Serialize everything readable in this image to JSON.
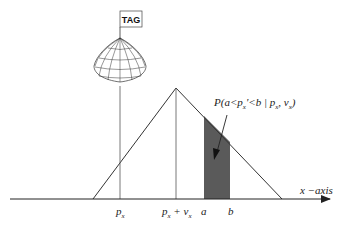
{
  "diagram": {
    "tag_label": "TAG",
    "probability_label": "P(a<p",
    "probability_label_full": "P(a<p'x<b | px, vx)",
    "prob_parts": {
      "prefix": "P(a<p",
      "sub1": "x",
      "mid": "'<b | p",
      "sub2": "x",
      "comma": ", v",
      "sub3": "x",
      "suffix": ")"
    },
    "x_axis_label": "x −axis",
    "ticks": {
      "px": {
        "main": "p",
        "sub": "x"
      },
      "px_plus_vx": {
        "main": "p",
        "sub": "x",
        "plus": " + v",
        "sub2": "x"
      },
      "a": "a",
      "b": "b"
    },
    "colors": {
      "line": "#333333",
      "shade": "#5a5a5a",
      "background": "#ffffff"
    }
  }
}
